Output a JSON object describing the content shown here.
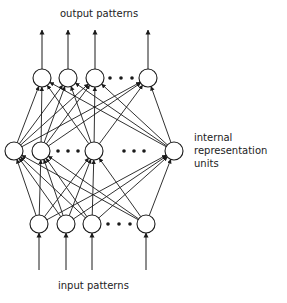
{
  "labels": {
    "output": "output patterns",
    "input": "input patterns",
    "hidden": [
      "internal",
      "representation",
      "units"
    ]
  },
  "layers": {
    "output": {
      "y": 78,
      "x": [
        42,
        68,
        95,
        148
      ],
      "ellipsis_x": [
        110,
        121,
        132
      ]
    },
    "hidden": {
      "y": 151,
      "x": [
        14,
        41,
        94,
        174
      ],
      "ellipsis_x": [
        58,
        68,
        78,
        124,
        134,
        144
      ]
    },
    "input": {
      "y": 224,
      "x": [
        39,
        66,
        92,
        146
      ],
      "ellipsis_x": [
        108,
        119,
        130
      ]
    }
  },
  "node_radius": 9,
  "colors": {
    "stroke": "#1a1a1a",
    "background": "#ffffff"
  }
}
